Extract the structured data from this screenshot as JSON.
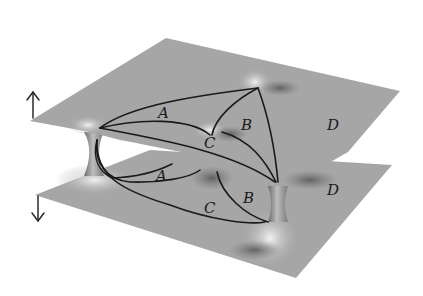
{
  "figure": {
    "colors": {
      "sheet": "#a6a6a6",
      "sheet_shadow": "#8a8a8a",
      "highlight": "#e6e6e6",
      "curve": "#1a1a1a",
      "background": "#ffffff"
    },
    "arrows": {
      "upper": "up-arrow",
      "lower": "down-arrow"
    },
    "upper_sheet": {
      "labels": {
        "a": "A",
        "b": "B",
        "c": "C",
        "d": "D"
      }
    },
    "lower_sheet": {
      "labels": {
        "a": "A",
        "b": "B",
        "c": "C",
        "d": "D"
      }
    }
  }
}
